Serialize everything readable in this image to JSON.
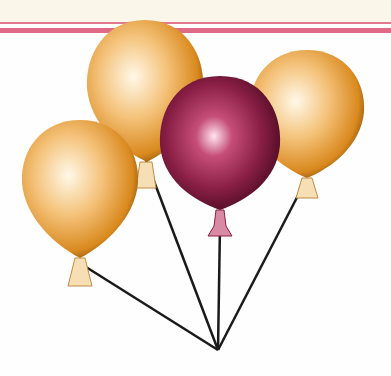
{
  "scene": {
    "description": "Four balloons tied together: three golden, one maroon in front",
    "colors": {
      "background": "#fefefe",
      "top_band": "#fbf6ea",
      "stripe": "#e06a86",
      "gold_balloon": "#e8a040",
      "maroon_balloon": "#8a1f45",
      "string": "#1a1a1a"
    },
    "balloons": [
      {
        "name": "back-left-gold",
        "cx": 145,
        "cy": 78,
        "rx": 60,
        "ry": 60
      },
      {
        "name": "back-right-gold",
        "cx": 307,
        "cy": 108,
        "rx": 58,
        "ry": 58
      },
      {
        "name": "front-left-gold",
        "cx": 80,
        "cy": 186,
        "rx": 60,
        "ry": 60
      },
      {
        "name": "center-maroon",
        "cx": 220,
        "cy": 142,
        "rx": 60,
        "ry": 64
      }
    ],
    "knot_point": {
      "x": 218,
      "y": 350
    }
  }
}
